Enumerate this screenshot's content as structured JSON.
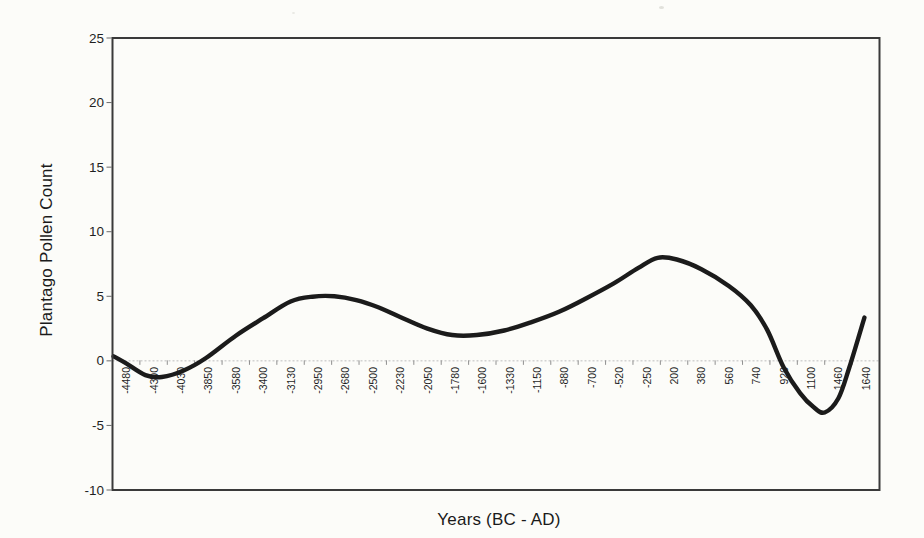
{
  "figure": {
    "background_color": "#fcfcf9"
  },
  "chart_data": {
    "type": "line",
    "title": "",
    "xlabel": "Years (BC - AD)",
    "ylabel": "Plantago Pollen Count",
    "categories": [
      "-4480",
      "-4300",
      "-4030",
      "-3850",
      "-3580",
      "-3400",
      "-3130",
      "-2950",
      "-2680",
      "-2500",
      "-2230",
      "-2050",
      "-1780",
      "-1600",
      "-1330",
      "-1150",
      "-880",
      "-700",
      "-520",
      "-250",
      "200",
      "380",
      "560",
      "740",
      "920",
      "1100",
      "1460",
      "1640"
    ],
    "yticks": [
      25,
      20,
      15,
      10,
      5,
      0,
      -5,
      -10
    ],
    "ylim": [
      -10,
      25
    ],
    "grid": {
      "zero_line_only": true,
      "zero_line_style": "dotted",
      "zero_line_color": "#bdbdbd"
    },
    "legend": "none",
    "axis_colors": {
      "plot_border": "#3a3a3a",
      "tick_color": "#8f8f8f",
      "text_color": "#1f1f1f"
    },
    "series": [
      {
        "name": "Plantago pollen count (smoothed curve)",
        "color": "#1b1b1b",
        "stroke_width": 4.4,
        "values_at_categories": [
          -0.2,
          -1.2,
          -0.75,
          0.5,
          1.95,
          3.3,
          4.6,
          5.0,
          4.8,
          4.35,
          3.4,
          2.5,
          2.0,
          2.1,
          2.5,
          3.1,
          4.1,
          5.1,
          6.3,
          7.95,
          7.85,
          7.1,
          5.8,
          3.1,
          -0.5,
          -3.6,
          -2.7,
          3.3
        ],
        "smooth_curve_samples_category_units": [
          [
            -0.46,
            0.35
          ],
          [
            0,
            -0.2
          ],
          [
            0.7,
            -1.1
          ],
          [
            1.3,
            -1.25
          ],
          [
            2.1,
            -0.75
          ],
          [
            2.9,
            0.2
          ],
          [
            4,
            1.95
          ],
          [
            5,
            3.3
          ],
          [
            6,
            4.6
          ],
          [
            6.8,
            4.97
          ],
          [
            7.6,
            5.0
          ],
          [
            8.4,
            4.7
          ],
          [
            9.2,
            4.15
          ],
          [
            10,
            3.4
          ],
          [
            11,
            2.5
          ],
          [
            11.9,
            2.0
          ],
          [
            12.8,
            2.0
          ],
          [
            13.8,
            2.35
          ],
          [
            14.8,
            3.0
          ],
          [
            15.8,
            3.8
          ],
          [
            16.8,
            4.85
          ],
          [
            17.8,
            6.0
          ],
          [
            18.7,
            7.2
          ],
          [
            19.4,
            7.98
          ],
          [
            20.1,
            7.85
          ],
          [
            21,
            7.1
          ],
          [
            22,
            5.8
          ],
          [
            22.8,
            4.3
          ],
          [
            23.4,
            2.4
          ],
          [
            24,
            -0.5
          ],
          [
            24.6,
            -2.5
          ],
          [
            25.1,
            -3.6
          ],
          [
            25.5,
            -4.0
          ],
          [
            26,
            -2.9
          ],
          [
            26.4,
            -0.5
          ],
          [
            26.95,
            3.35
          ]
        ]
      }
    ]
  }
}
